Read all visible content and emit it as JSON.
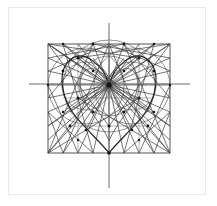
{
  "canvas": {
    "width": 217,
    "height": 206,
    "background_color": "#ffffff",
    "frame": {
      "x": 8,
      "y": 7,
      "width": 198,
      "height": 188,
      "border_color": "#e9e9e9",
      "fill_color": "#ffffff"
    }
  },
  "figure": {
    "stroke_color": "#3a3a3a",
    "accent_color": "#6f6f6f",
    "node_color": "#1c1c1c",
    "line_width": 0.7,
    "hub": {
      "x": 109,
      "y": 85,
      "label": "cusp-hub"
    },
    "bounding_square": {
      "left": 48,
      "top": 44,
      "right": 170,
      "bottom": 153,
      "stroke": "#555555"
    },
    "axes": {
      "vertical": {
        "x": 109,
        "y1": 23,
        "y2": 188,
        "stroke": "#6b6b6b"
      },
      "horizontal": {
        "y": 84,
        "x1": 29,
        "x2": 190,
        "stroke": "#6b6b6b"
      }
    },
    "heart": {
      "cusp": {
        "x": 109,
        "y": 85
      },
      "tip": {
        "x": 109,
        "y": 153
      },
      "left_lobe_peak": {
        "x": 74,
        "y": 57
      },
      "right_lobe_peak": {
        "x": 144,
        "y": 57
      },
      "left_extreme": {
        "x": 62,
        "y": 94
      },
      "right_extreme": {
        "x": 156,
        "y": 94
      },
      "stroke": "#2b2b2b"
    },
    "arcs": [
      {
        "cx": 86,
        "cy": 86,
        "r": 24,
        "name": "left-inner-circle"
      },
      {
        "cx": 132,
        "cy": 86,
        "r": 24,
        "name": "right-inner-circle"
      },
      {
        "cx": 86,
        "cy": 86,
        "r": 38,
        "name": "left-outer-circle"
      },
      {
        "cx": 132,
        "cy": 86,
        "r": 38,
        "name": "right-outer-circle"
      },
      {
        "cx": 109,
        "cy": 86,
        "r": 46,
        "name": "center-circle"
      },
      {
        "cx": 109,
        "cy": 86,
        "r": 30,
        "name": "center-inner-circle"
      }
    ],
    "grid": {
      "columns": [
        48,
        63,
        78,
        93,
        109,
        124,
        139,
        154,
        170
      ],
      "rows": [
        44,
        58,
        71,
        85,
        98,
        112,
        126,
        140,
        153
      ]
    },
    "node_count": 41,
    "spoke_count": 36
  }
}
